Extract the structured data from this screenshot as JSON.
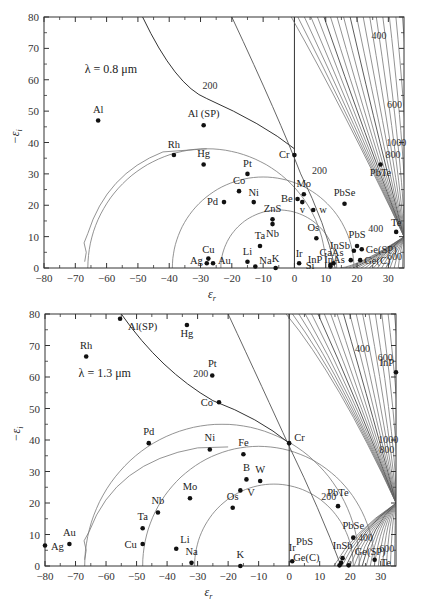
{
  "chart_data": [
    {
      "type": "scatter",
      "title": "λ = 0.8 μm",
      "xlabel": "ε_r",
      "ylabel": "−ε_i",
      "xlim": [
        -80,
        35
      ],
      "ylim": [
        0,
        80
      ],
      "x_ticks": [
        -80,
        -70,
        -60,
        -50,
        -40,
        -30,
        -20,
        -10,
        0,
        10,
        20,
        30
      ],
      "y_ticks": [
        0,
        10,
        20,
        30,
        40,
        50,
        60,
        70,
        80
      ],
      "grid": false,
      "contour_labels": [
        "200",
        "200",
        "400",
        "400",
        "600",
        "600",
        "800",
        "1000"
      ],
      "points": [
        {
          "label": "Al",
          "x": -62.7,
          "y": 47
        },
        {
          "label": "Al (SP)",
          "x": -29,
          "y": 45.5
        },
        {
          "label": "Rh",
          "x": -38.5,
          "y": 36
        },
        {
          "label": "Hg",
          "x": -29,
          "y": 33
        },
        {
          "label": "Pt",
          "x": -15,
          "y": 30
        },
        {
          "label": "Co",
          "x": -17.7,
          "y": 24.5
        },
        {
          "label": "Ni",
          "x": -13,
          "y": 21
        },
        {
          "label": "Pd",
          "x": -22.5,
          "y": 21
        },
        {
          "label": "Cr",
          "x": 0,
          "y": 36
        },
        {
          "label": "Mo",
          "x": 3,
          "y": 23.5
        },
        {
          "label": "Be",
          "x": 1,
          "y": 22
        },
        {
          "label": "v",
          "x": 2.5,
          "y": 21
        },
        {
          "label": "w",
          "x": 6,
          "y": 18.5
        },
        {
          "label": "ZnS",
          "x": -7,
          "y": 15.5
        },
        {
          "label": "Nb",
          "x": -7,
          "y": 14
        },
        {
          "label": "Ta",
          "x": -11,
          "y": 7
        },
        {
          "label": "Os",
          "x": 7,
          "y": 9.5
        },
        {
          "label": "PbSe",
          "x": 16,
          "y": 20.5
        },
        {
          "label": "PbTe",
          "x": 27.5,
          "y": 33
        },
        {
          "label": "Te",
          "x": 32.5,
          "y": 11.5
        },
        {
          "label": "PbS",
          "x": 20,
          "y": 7
        },
        {
          "label": "InSb",
          "x": 19,
          "y": 5.5
        },
        {
          "label": "Ge(SP)",
          "x": 21.5,
          "y": 6
        },
        {
          "label": "InAs",
          "x": 18,
          "y": 2.5
        },
        {
          "label": "Ge(C)",
          "x": 21,
          "y": 2.5
        },
        {
          "label": "GaAs",
          "x": 12.5,
          "y": 1.5
        },
        {
          "label": "InP",
          "x": 11.5,
          "y": 1
        },
        {
          "label": "Si",
          "x": 11.5,
          "y": 0.5
        },
        {
          "label": "Ir",
          "x": 1.5,
          "y": 1.5
        },
        {
          "label": "Cu",
          "x": -27.5,
          "y": 3
        },
        {
          "label": "Ag",
          "x": -28,
          "y": 1.5
        },
        {
          "label": "Au",
          "x": -26,
          "y": 1.5
        },
        {
          "label": "Li",
          "x": -15,
          "y": 2
        },
        {
          "label": "Na",
          "x": -12.5,
          "y": 0.5
        },
        {
          "label": "K",
          "x": -6,
          "y": 0
        }
      ]
    },
    {
      "type": "scatter",
      "title": "λ = 1.3 μm",
      "xlabel": "ε_r",
      "ylabel": "−ε_i",
      "xlim": [
        -80,
        35
      ],
      "ylim": [
        0,
        80
      ],
      "x_ticks": [
        -80,
        -70,
        -60,
        -50,
        -40,
        -30,
        -20,
        -10,
        0,
        10,
        20,
        30
      ],
      "y_ticks": [
        0,
        10,
        20,
        30,
        40,
        50,
        60,
        70,
        80
      ],
      "grid": false,
      "contour_labels": [
        "200",
        "200",
        "400",
        "400",
        "600",
        "600",
        "800",
        "1000"
      ],
      "points": [
        {
          "label": "Al(SP)",
          "x": -55.4,
          "y": 78.5
        },
        {
          "label": "Hg",
          "x": -33.5,
          "y": 76.5
        },
        {
          "label": "Rh",
          "x": -66.5,
          "y": 66.5
        },
        {
          "label": "Pt",
          "x": -25.2,
          "y": 60.5
        },
        {
          "label": "Co",
          "x": -23,
          "y": 52
        },
        {
          "label": "Cr",
          "x": 0,
          "y": 39
        },
        {
          "label": "Pd",
          "x": -46,
          "y": 39
        },
        {
          "label": "Ni",
          "x": -26,
          "y": 37
        },
        {
          "label": "Fe",
          "x": -15,
          "y": 35.5
        },
        {
          "label": "B",
          "x": -14,
          "y": 27.5
        },
        {
          "label": "W",
          "x": -9.5,
          "y": 27
        },
        {
          "label": "V",
          "x": -16,
          "y": 24
        },
        {
          "label": "Mo",
          "x": -32.5,
          "y": 21.5
        },
        {
          "label": "Os",
          "x": -18.5,
          "y": 18.5
        },
        {
          "label": "Nb",
          "x": -43,
          "y": 17
        },
        {
          "label": "Ta",
          "x": -48,
          "y": 12
        },
        {
          "label": "Cu",
          "x": -48,
          "y": 7
        },
        {
          "label": "Au",
          "x": -72,
          "y": 7
        },
        {
          "label": "Ag",
          "x": -80,
          "y": 6.5
        },
        {
          "label": "Li",
          "x": -37,
          "y": 5.5
        },
        {
          "label": "Na",
          "x": -32,
          "y": 1
        },
        {
          "label": "K",
          "x": -16,
          "y": 0
        },
        {
          "label": "Ir",
          "x": 1,
          "y": 1.5
        },
        {
          "label": "PbTe",
          "x": 16,
          "y": 19
        },
        {
          "label": "PbSe",
          "x": 21,
          "y": 9
        },
        {
          "label": "Te",
          "x": 28,
          "y": 2
        },
        {
          "label": "InSb",
          "x": 17.5,
          "y": 2.5
        },
        {
          "label": "PbS",
          "x": 17,
          "y": 1
        },
        {
          "label": "Ge(SP)",
          "x": 19.5,
          "y": 0.2
        },
        {
          "label": "Ge(C)",
          "x": 16.5,
          "y": 0.2
        },
        {
          "label": "InP",
          "x": 35,
          "y": 61.5
        }
      ]
    }
  ],
  "figure": {
    "top_lambda": "λ = 0.8 μm",
    "bottom_lambda": "λ = 1.3 μm",
    "xlabel": "εr",
    "ylabel": "−εi"
  }
}
